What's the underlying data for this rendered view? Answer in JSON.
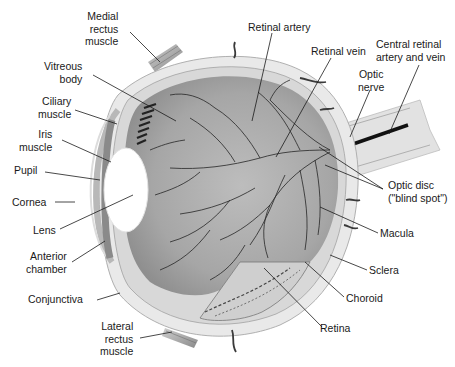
{
  "diagram": {
    "type": "anatomical-illustration",
    "labels": {
      "medial_rectus": [
        "Medial",
        "rectus",
        "muscle"
      ],
      "vitreous_body": [
        "Vitreous",
        "body"
      ],
      "ciliary_muscle": [
        "Ciliary",
        "muscle"
      ],
      "iris_muscle": [
        "Iris",
        "muscle"
      ],
      "pupil": [
        "Pupil"
      ],
      "cornea": [
        "Cornea"
      ],
      "lens": [
        "Lens"
      ],
      "anterior_chamber": [
        "Anterior",
        "chamber"
      ],
      "conjunctiva": [
        "Conjunctiva"
      ],
      "lateral_rectus": [
        "Lateral",
        "rectus",
        "muscle"
      ],
      "retinal_artery": [
        "Retinal artery"
      ],
      "retinal_vein": [
        "Retinal vein"
      ],
      "central_retinal": [
        "Central retinal",
        "artery and vein"
      ],
      "optic_nerve": [
        "Optic",
        "nerve"
      ],
      "optic_disc": [
        "Optic disc",
        "(\"blind spot\")"
      ],
      "macula": [
        "Macula"
      ],
      "sclera": [
        "Sclera"
      ],
      "choroid": [
        "Choroid"
      ],
      "retina": [
        "Retina"
      ]
    },
    "colors": {
      "background": "#ffffff",
      "ink": "#1a1a1a",
      "vitreous": "#a9a9a9",
      "sclera": "#e6e6e6",
      "vessels": "#2a2a2a",
      "lens": "#ffffff"
    }
  }
}
